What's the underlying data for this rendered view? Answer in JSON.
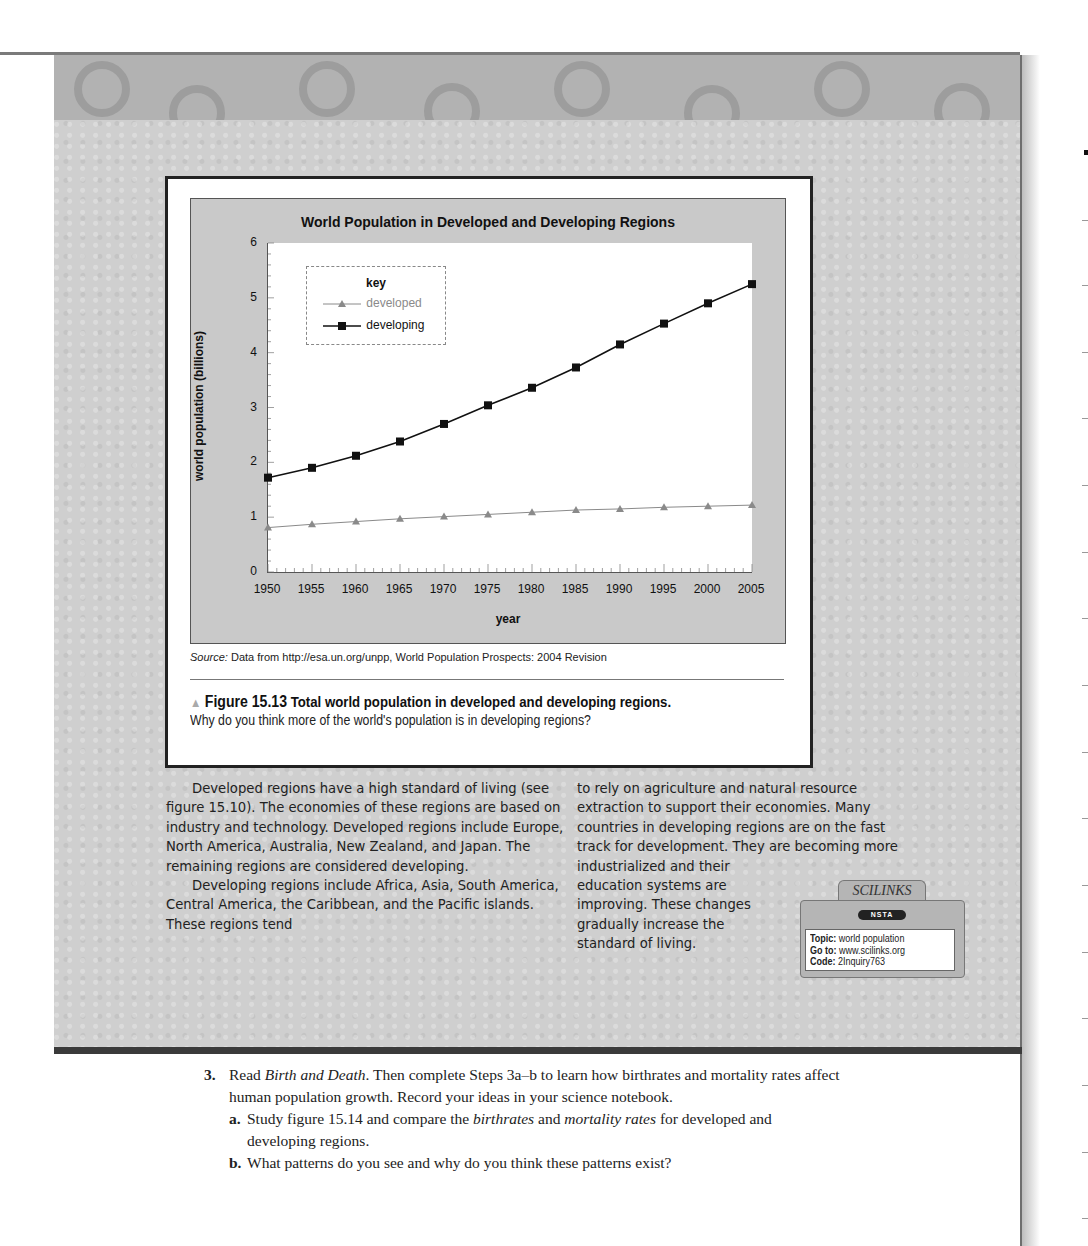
{
  "chart_data": {
    "type": "line",
    "title": "World Population in Developed and Developing Regions",
    "xlabel": "year",
    "ylabel": "world population (billions)",
    "x": [
      1950,
      1955,
      1960,
      1965,
      1970,
      1975,
      1980,
      1985,
      1990,
      1995,
      2000,
      2005
    ],
    "series": [
      {
        "name": "developed",
        "marker": "triangle",
        "color": "#8a8a8a",
        "values": [
          0.81,
          0.87,
          0.92,
          0.97,
          1.01,
          1.05,
          1.09,
          1.13,
          1.15,
          1.18,
          1.2,
          1.22
        ]
      },
      {
        "name": "developing",
        "marker": "square",
        "color": "#111111",
        "values": [
          1.72,
          1.9,
          2.12,
          2.38,
          2.7,
          3.04,
          3.36,
          3.73,
          4.15,
          4.53,
          4.9,
          5.25
        ]
      }
    ],
    "ylim": [
      0,
      6
    ],
    "yticks": [
      0,
      1,
      2,
      3,
      4,
      5,
      6
    ],
    "legend": {
      "title": "key",
      "position": "upper-left"
    },
    "grid": false
  },
  "chart": {
    "title": "World Population in Developed and Developing Regions",
    "ylabel": "world population (billions)",
    "xlabel": "year",
    "yticks": [
      "0",
      "1",
      "2",
      "3",
      "4",
      "5",
      "6"
    ],
    "xticks": [
      "1950",
      "1955",
      "1960",
      "1965",
      "1970",
      "1975",
      "1980",
      "1985",
      "1990",
      "1995",
      "2000",
      "2005"
    ],
    "legend": {
      "title": "key",
      "items": [
        "developed",
        "developing"
      ]
    }
  },
  "source": {
    "label": "Source:",
    "text": " Data from http://esa.un.org/unpp, World Population Prospects: 2004 Revision"
  },
  "figure": {
    "number": "Figure 15.13",
    "title": "Total world population in developed and developing regions.",
    "question": "Why do you think more of the world's population is in developing regions?"
  },
  "body": {
    "left_paragraphs": [
      "Developed regions have a high standard of living (see figure 15.10). The economies of these regions are based on industry and technology. Developed regions include Europe, North America, Australia, New Zealand, and Japan. The remaining regions are considered developing.",
      "Developing regions include Africa, Asia, South America, Central America, the Caribbean, and the Pacific islands. These regions tend"
    ],
    "right_lines": [
      "to rely on agriculture and natural resource",
      "extraction to support their economies. Many",
      "countries in developing regions are on the fast",
      "track for development. They are becoming more",
      "industrialized and their",
      "education systems are",
      "improving. These changes",
      "gradually increase the",
      "standard of living."
    ]
  },
  "scilinks": {
    "logo": "SCILINKS",
    "badge": "NSTA",
    "topic_label": "Topic:",
    "topic": " world population",
    "goto_label": "Go to:",
    "goto": " www.scilinks.org",
    "code_label": "Code:",
    "code": " 2Inquiry763"
  },
  "steps": {
    "number": "3.",
    "intro_pre": "Read ",
    "intro_title": "Birth and Death",
    "intro_post": ". Then complete Steps 3a–b to learn how birthrates and mortality rates affect human population growth. Record your ideas in your science notebook.",
    "a_letter": "a.",
    "a_pre": "Study figure 15.14 and compare the ",
    "a_em1": "birthrates",
    "a_mid": " and ",
    "a_em2": "mortality rates",
    "a_post": " for developed and developing regions.",
    "b_letter": "b.",
    "b_text": "What patterns do you see and why do you think these patterns exist?"
  }
}
